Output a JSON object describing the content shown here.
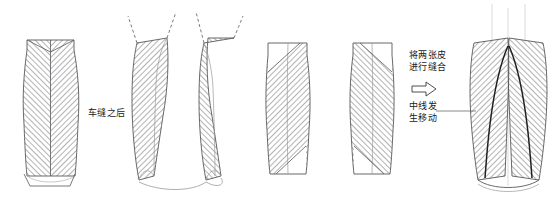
{
  "annotations": {
    "after_sewing": "车缝之后",
    "join_two_pieces_line1": "将两张皮",
    "join_two_pieces_line2": "进行缝合",
    "centerline_shift_line1": "中线发",
    "centerline_shift_line2": "生移动"
  },
  "icons": {
    "arrow_right": "right-arrow-outline"
  },
  "colors": {
    "outline": "#58585a",
    "hatch": "#9a9a9c",
    "seam_dark": "#1f1f1f",
    "construction": "#b9b9bb",
    "text": "#1a1a1a",
    "background": "#ffffff"
  },
  "figures": [
    {
      "name": "panel-sewn-single",
      "label": "车缝之后",
      "hatch_style": "chevron",
      "description": "single sewn vase-shaped panel with mirrored chevron hatching and vertical center seam"
    },
    {
      "name": "panel-pair-separated",
      "hatch_style": "diagonal-mirrored",
      "description": "two mirror-image panels separated with dashed construction lines extending upward"
    },
    {
      "name": "panel-flat-left",
      "hatch_style": "diagonal-right",
      "description": "single flat panel with uniform diagonal hatching rising to the right"
    },
    {
      "name": "panel-flat-right",
      "hatch_style": "diagonal-left",
      "description": "mirror panel with uniform diagonal hatching rising to the left"
    },
    {
      "name": "panel-joined-result",
      "hatch_style": "diagonal-mirrored",
      "description": "joined result showing two dark curved seam lines and shifted center line"
    }
  ]
}
